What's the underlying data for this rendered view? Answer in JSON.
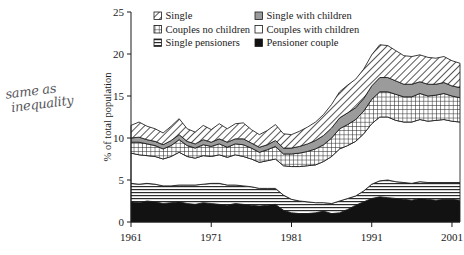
{
  "annotation": {
    "line1": "same as",
    "line2": "inequality"
  },
  "chart_data": {
    "type": "area",
    "stacked": true,
    "title": "",
    "xlabel": "",
    "ylabel": "% of total population",
    "xlim": [
      1961,
      2002
    ],
    "ylim": [
      0,
      25
    ],
    "yticks": [
      0,
      5,
      10,
      15,
      20,
      25
    ],
    "xticks": [
      1961,
      1971,
      1981,
      1991,
      2001
    ],
    "grid": false,
    "legend_position": "top-inside",
    "x": [
      1961,
      1962,
      1963,
      1964,
      1965,
      1966,
      1967,
      1968,
      1969,
      1970,
      1971,
      1972,
      1973,
      1974,
      1975,
      1976,
      1977,
      1978,
      1979,
      1980,
      1981,
      1982,
      1983,
      1984,
      1985,
      1986,
      1987,
      1988,
      1989,
      1990,
      1991,
      1992,
      1993,
      1994,
      1995,
      1996,
      1997,
      1998,
      1999,
      2000,
      2001,
      2002
    ],
    "series": [
      {
        "name": "Pensioner couple",
        "pattern": "solid-black",
        "color": "#111111",
        "values": [
          2.4,
          2.3,
          2.5,
          2.4,
          2.2,
          2.3,
          2.4,
          2.2,
          2.1,
          2.3,
          2.2,
          2.1,
          2.0,
          2.2,
          2.1,
          2.0,
          1.9,
          2.0,
          2.1,
          1.4,
          1.1,
          1.0,
          1.0,
          1.1,
          1.3,
          1.0,
          1.1,
          1.5,
          2.0,
          2.4,
          2.8,
          3.0,
          2.9,
          2.8,
          2.7,
          2.6,
          2.8,
          2.7,
          2.6,
          2.7,
          2.7,
          2.6
        ]
      },
      {
        "name": "Single pensioners",
        "pattern": "horizontal-lines",
        "color": "#cfcfcf",
        "values": [
          2.2,
          2.2,
          2.1,
          2.1,
          2.1,
          2.0,
          2.0,
          2.2,
          2.3,
          2.2,
          2.4,
          2.5,
          2.4,
          2.2,
          2.2,
          2.2,
          2.1,
          2.0,
          1.9,
          1.8,
          1.6,
          1.5,
          1.4,
          1.2,
          1.0,
          1.2,
          1.4,
          1.3,
          1.1,
          1.3,
          1.7,
          1.9,
          2.1,
          2.0,
          2.0,
          2.0,
          2.0,
          2.0,
          2.1,
          2.0,
          2.0,
          2.1
        ]
      },
      {
        "name": "Couples with children",
        "pattern": "white",
        "color": "#ffffff",
        "values": [
          3.6,
          3.5,
          3.3,
          3.3,
          3.2,
          3.5,
          3.9,
          3.4,
          3.2,
          3.4,
          3.2,
          3.4,
          3.3,
          3.6,
          3.5,
          3.3,
          3.1,
          3.3,
          3.5,
          3.5,
          3.9,
          4.1,
          4.3,
          4.5,
          4.9,
          5.6,
          6.2,
          6.3,
          6.5,
          6.8,
          7.2,
          7.6,
          7.5,
          7.3,
          7.2,
          7.3,
          7.4,
          7.3,
          7.4,
          7.5,
          7.3,
          7.2
        ]
      },
      {
        "name": "Couples no children",
        "pattern": "crosshatch",
        "color": "#e0e0e0",
        "values": [
          1.3,
          1.5,
          1.4,
          1.3,
          1.2,
          1.3,
          1.5,
          1.3,
          1.2,
          1.3,
          1.2,
          1.3,
          1.2,
          1.3,
          1.4,
          1.3,
          1.2,
          1.3,
          1.5,
          1.4,
          1.5,
          1.6,
          1.7,
          1.9,
          2.0,
          2.2,
          2.4,
          2.5,
          2.6,
          2.7,
          2.9,
          3.0,
          3.0,
          3.1,
          3.0,
          3.0,
          3.1,
          3.0,
          3.0,
          3.1,
          3.0,
          2.9
        ]
      },
      {
        "name": "Single with children",
        "pattern": "solid-grey",
        "color": "#9b9b9b",
        "values": [
          0.5,
          0.6,
          0.5,
          0.5,
          0.5,
          0.6,
          0.6,
          0.5,
          0.5,
          0.6,
          0.5,
          0.6,
          0.6,
          0.6,
          0.7,
          0.6,
          0.6,
          0.6,
          0.7,
          0.7,
          0.7,
          0.8,
          0.9,
          1.0,
          1.1,
          1.2,
          1.3,
          1.4,
          1.4,
          1.5,
          1.6,
          1.7,
          1.7,
          1.6,
          1.5,
          1.5,
          1.4,
          1.4,
          1.3,
          1.3,
          1.2,
          1.2
        ]
      },
      {
        "name": "Single",
        "pattern": "diagonal-hatch",
        "color": "#dcdcdc",
        "values": [
          1.5,
          1.8,
          1.6,
          1.5,
          1.4,
          1.7,
          1.9,
          1.5,
          1.4,
          1.7,
          1.5,
          1.8,
          1.6,
          1.8,
          1.9,
          1.6,
          1.5,
          1.7,
          1.9,
          1.7,
          1.6,
          1.8,
          2.0,
          2.2,
          2.5,
          2.8,
          3.1,
          3.3,
          3.4,
          3.5,
          3.7,
          3.9,
          3.8,
          3.6,
          3.4,
          3.3,
          3.2,
          3.2,
          3.1,
          3.1,
          3.0,
          2.9
        ]
      }
    ],
    "legend": [
      {
        "label": "Single",
        "pattern": "diagonal-hatch"
      },
      {
        "label": "Single with children",
        "pattern": "solid-grey"
      },
      {
        "label": "Couples no children",
        "pattern": "crosshatch"
      },
      {
        "label": "Couples with children",
        "pattern": "white"
      },
      {
        "label": "Single pensioners",
        "pattern": "horizontal-lines"
      },
      {
        "label": "Pensioner couple",
        "pattern": "solid-black"
      }
    ]
  }
}
